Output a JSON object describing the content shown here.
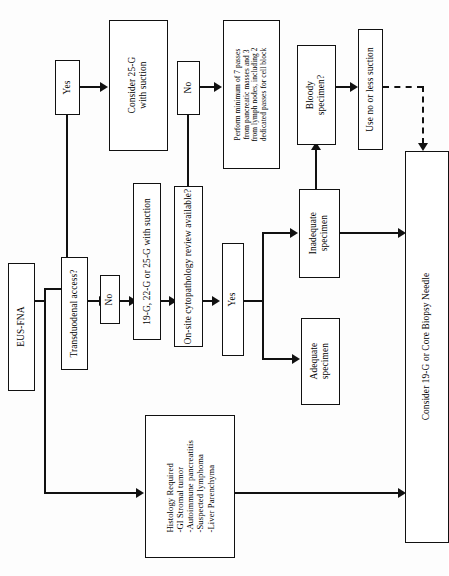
{
  "diagram": {
    "orientation": "rotated-90",
    "ink_color": "#111111",
    "background_color": "#ffffff"
  },
  "nodes": {
    "eus_fna": "EUS-FNA",
    "transduodenal_access": "Transduodenal access?",
    "branch_yes_1": "Yes",
    "branch_no_1": "No",
    "consider_25g": "Consider 25-G\nwith suction",
    "needle_choice": "19-G, 22-G or 25-G with suction",
    "onsite_review": "On-site cytopathology review available?",
    "branch_no_2": "No",
    "branch_yes_2": "Yes",
    "perform_passes": "Perform minimum of 7 passes\nfrom pancreatic masses and 3\nfrom lymph nodes, including 2\ndedicated passes for cell block",
    "inadequate_specimen": "Inadequate\nspecimen",
    "adequate_specimen": "Adequate\nspecimen",
    "bloody_specimen": "Bloody\nspecimen?",
    "use_no_or_less_suction": "Use no or less suction",
    "histology_required": "Histology Required\n-GI Stromal tumor\n-Autoimmune pancreatitis\n-Suspected lymphoma\n-Liver Parenchyma",
    "consider_19g_core": "Consider 19-G or Core Biopsy Needle"
  },
  "edges": [
    {
      "from": "eus_fna",
      "to": "transduodenal_access",
      "style": "solid"
    },
    {
      "from": "eus_fna",
      "to": "histology_required",
      "style": "solid",
      "arrow": true
    },
    {
      "from": "transduodenal_access",
      "to": "branch_yes_1",
      "style": "solid"
    },
    {
      "from": "transduodenal_access",
      "to": "branch_no_1",
      "style": "solid",
      "arrow": true
    },
    {
      "from": "branch_yes_1",
      "to": "consider_25g",
      "style": "solid",
      "arrow": true
    },
    {
      "from": "branch_no_1",
      "to": "needle_choice",
      "style": "solid",
      "arrow": true
    },
    {
      "from": "needle_choice",
      "to": "onsite_review",
      "style": "solid",
      "arrow": true
    },
    {
      "from": "onsite_review",
      "to": "branch_no_2",
      "style": "solid"
    },
    {
      "from": "onsite_review",
      "to": "branch_yes_2",
      "style": "solid",
      "arrow": true
    },
    {
      "from": "branch_no_2",
      "to": "perform_passes",
      "style": "solid",
      "arrow": true
    },
    {
      "from": "branch_yes_2",
      "to": "inadequate_specimen",
      "style": "solid",
      "arrow": true
    },
    {
      "from": "branch_yes_2",
      "to": "adequate_specimen",
      "style": "solid",
      "arrow": true
    },
    {
      "from": "inadequate_specimen",
      "to": "bloody_specimen",
      "style": "solid",
      "arrow": true
    },
    {
      "from": "inadequate_specimen",
      "to": "consider_19g_core",
      "style": "solid",
      "arrow": true
    },
    {
      "from": "bloody_specimen",
      "to": "use_no_or_less_suction",
      "style": "solid",
      "arrow": true
    },
    {
      "from": "use_no_or_less_suction",
      "to": "consider_19g_core",
      "style": "dashed",
      "arrow": true
    },
    {
      "from": "histology_required",
      "to": "consider_19g_core",
      "style": "solid",
      "arrow": true
    }
  ]
}
